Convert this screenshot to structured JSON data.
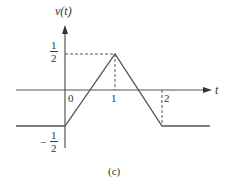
{
  "diagram": {
    "y_axis_label": "v(t)",
    "x_axis_label": "t",
    "caption": "(c)",
    "tick_labels": {
      "t0": "0",
      "t1": "1",
      "t2": "2",
      "v_pos_num": "1",
      "v_pos_den": "2",
      "v_neg_sign": "−",
      "v_neg_num": "1",
      "v_neg_den": "2"
    },
    "line_color": "#555555",
    "waveform": [
      {
        "t": "-inf",
        "v": -0.5
      },
      {
        "t": 0,
        "v": -0.5
      },
      {
        "t": 1,
        "v": 0.5
      },
      {
        "t": 2,
        "v": -0.5
      },
      {
        "t": "+inf",
        "v": -0.5
      }
    ]
  }
}
